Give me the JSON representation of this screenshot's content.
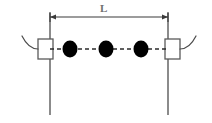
{
  "figure": {
    "type": "mechanics-schematic",
    "background_color": "#ffffff"
  },
  "dimension": {
    "label": "L",
    "label_x": 100,
    "label_y": 3,
    "line_y": 17,
    "x_start": 50,
    "x_end": 168,
    "color": "#3a3a3a",
    "arrow_size": 4
  },
  "supports": [
    {
      "name": "left-support",
      "wall_x": 50,
      "wall_top": 13,
      "wall_bottom": 115,
      "wall_color": "#6e6e6e",
      "wall_width": 1.6,
      "box_x": 38,
      "box_y": 39,
      "box_width": 15,
      "box_height": 20,
      "box_color": "#5a5a5a",
      "curve_path": "M 38 49 C 31 49 26 44 22 36",
      "curve_color": "#4a4a4a"
    },
    {
      "name": "right-support",
      "wall_x": 168,
      "wall_top": 13,
      "wall_bottom": 115,
      "wall_color": "#6e6e6e",
      "wall_width": 1.6,
      "box_x": 165,
      "box_y": 39,
      "box_width": 15,
      "box_height": 20,
      "box_color": "#5a5a5a",
      "curve_path": "M 180 49 C 187 49 192 44 196 36",
      "curve_color": "#4a4a4a"
    }
  ],
  "axis": {
    "name": "dashed-center-axis",
    "y": 49,
    "x_start": 50,
    "x_end": 168,
    "color": "#2b2b2b",
    "dash_pattern": "4 3",
    "width": 1.3
  },
  "beads": [
    {
      "label": "bead-1",
      "cx": 70,
      "cy": 49,
      "rx": 7.5,
      "ry": 8.5,
      "color": "#000000"
    },
    {
      "label": "bead-2",
      "cx": 106,
      "cy": 49,
      "rx": 7.5,
      "ry": 8.5,
      "color": "#000000"
    },
    {
      "label": "bead-3",
      "cx": 141,
      "cy": 49,
      "rx": 7.5,
      "ry": 8.5,
      "color": "#000000"
    }
  ]
}
